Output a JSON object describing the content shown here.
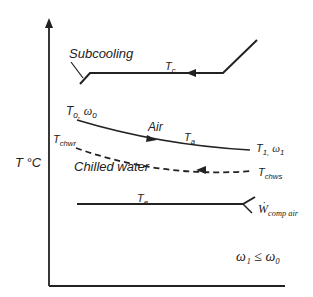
{
  "diagram": {
    "y_axis_label": "T °C",
    "labels": {
      "subcooling": "Subcooling",
      "tc": "T",
      "tc_sub": "c",
      "to": "T",
      "to_sub": "o,",
      "omega_o": "ω",
      "omega_o_sub": "o",
      "air": "Air",
      "ta": "T",
      "ta_sub": "a",
      "t1": "T",
      "t1_sub": "1,",
      "omega_1": "ω",
      "omega_1_sub": "1",
      "tchwr": "T",
      "tchwr_sub": "chwr",
      "chilled_water": "Chilled water",
      "tchws": "T",
      "tchws_sub": "chws",
      "te": "T",
      "te_sub": "e",
      "wcomp": "Ẇ",
      "wcomp_sub": "comp air",
      "condition": "ω₁ ≤ ω₀"
    },
    "colors": {
      "line": "#222222",
      "background": "#ffffff"
    }
  }
}
